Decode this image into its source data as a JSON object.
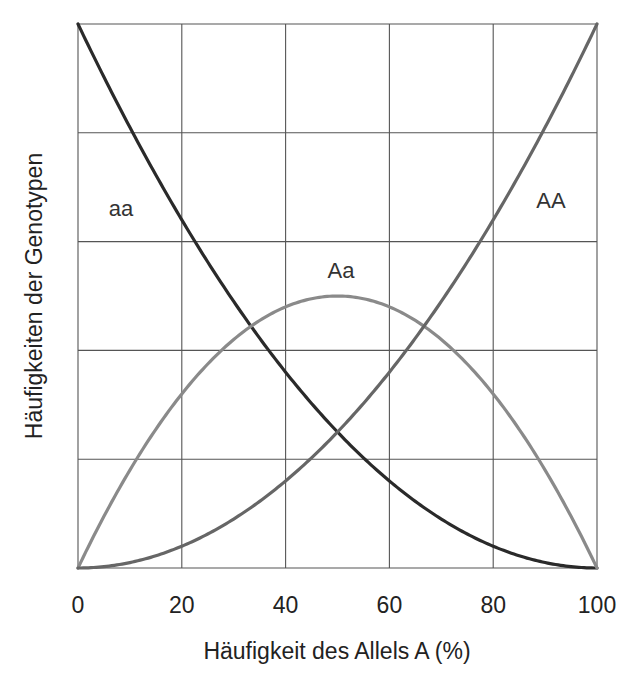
{
  "chart_data": {
    "type": "line",
    "title": "",
    "xlabel": "Häufigkeit des Allels A (%)",
    "ylabel": "Häufigkeiten der Genotypen",
    "xlim": [
      0,
      100
    ],
    "ylim": [
      0,
      1
    ],
    "x_ticks": [
      "0",
      "20",
      "40",
      "60",
      "80",
      "100"
    ],
    "y_ticks": [],
    "grid": true,
    "grid_rows": 5,
    "grid_cols": 5,
    "legend": "inline labels",
    "x": [
      0,
      10,
      20,
      30,
      40,
      50,
      60,
      70,
      80,
      90,
      100
    ],
    "series": [
      {
        "name": "aa",
        "label": "aa",
        "color": "#2a2a2a",
        "formula": "(1-p)^2",
        "values": [
          1.0,
          0.81,
          0.64,
          0.49,
          0.36,
          0.25,
          0.16,
          0.09,
          0.04,
          0.01,
          0.0
        ]
      },
      {
        "name": "Aa",
        "label": "Aa",
        "color": "#8a8a8a",
        "formula": "2p(1-p)",
        "values": [
          0.0,
          0.18,
          0.32,
          0.42,
          0.48,
          0.5,
          0.48,
          0.42,
          0.32,
          0.18,
          0.0
        ]
      },
      {
        "name": "AA",
        "label": "AA",
        "color": "#666666",
        "formula": "p^2",
        "values": [
          0.0,
          0.01,
          0.04,
          0.09,
          0.16,
          0.25,
          0.36,
          0.49,
          0.64,
          0.81,
          1.0
        ]
      }
    ],
    "annotations": [
      {
        "text": "aa",
        "x": 8,
        "y": 0.7
      },
      {
        "text": "Aa",
        "x": 50,
        "y": 0.53
      },
      {
        "text": "AA",
        "x": 92,
        "y": 0.7
      }
    ]
  },
  "plot": {
    "left": 78,
    "right": 597,
    "top": 24,
    "bottom": 568,
    "grid_color": "#555555",
    "frame_color": "#555555"
  }
}
